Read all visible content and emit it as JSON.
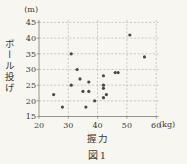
{
  "figure": {
    "caption": "図1",
    "colors": {
      "background": "#f7f6f1",
      "text": "#3b3935",
      "grid": "#b8b4ac",
      "axis": "#8c8980",
      "point": "#4a4a4a"
    }
  },
  "chart_data": {
    "type": "scatter",
    "title": "図1",
    "x_title": "握力",
    "x_unit_label": "(kg)",
    "y_title": "ボール投げ",
    "y_unit_label": "(m)",
    "xlabel": "握力 (kg)",
    "ylabel": "ボール投げ (m)",
    "xlim": [
      20,
      60
    ],
    "ylim": [
      15,
      45
    ],
    "x_ticks": [
      20,
      30,
      40,
      50,
      60
    ],
    "y_ticks": [
      15,
      20,
      25,
      30,
      35,
      40,
      45
    ],
    "grid": true,
    "legend": false,
    "points": [
      [
        25,
        22
      ],
      [
        28,
        18
      ],
      [
        31,
        25
      ],
      [
        31,
        35
      ],
      [
        33,
        30
      ],
      [
        34,
        27
      ],
      [
        37,
        26
      ],
      [
        35,
        23
      ],
      [
        37,
        23
      ],
      [
        36,
        18
      ],
      [
        39,
        20
      ],
      [
        42,
        28
      ],
      [
        42,
        25
      ],
      [
        42,
        24
      ],
      [
        42,
        21
      ],
      [
        43,
        22
      ],
      [
        46,
        29
      ],
      [
        47,
        29
      ],
      [
        51,
        41
      ],
      [
        56,
        34
      ]
    ]
  }
}
